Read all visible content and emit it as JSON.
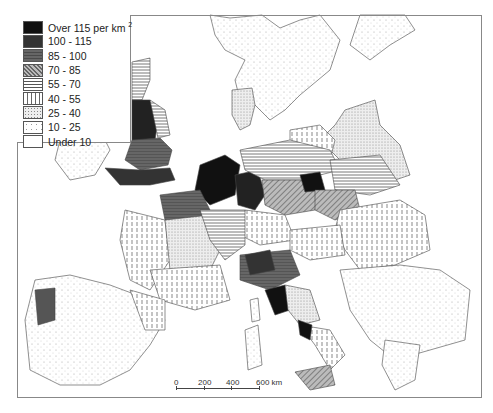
{
  "map": {
    "subject": "Population density, Europe",
    "legend": {
      "items": [
        {
          "label": "Over 115 per km",
          "sup": "2",
          "pattern": "solid-black",
          "fill": "#111111"
        },
        {
          "label": "100 - 115",
          "pattern": "dark-grey",
          "fill": "#3a3a3a"
        },
        {
          "label": "85 - 100",
          "pattern": "mid-dark-grey",
          "fill": "#666666"
        },
        {
          "label": "70 - 85",
          "pattern": "diagonal-hatch",
          "fill": "#9a9a9a"
        },
        {
          "label": "55 - 70",
          "pattern": "horizontal-lines",
          "fill": "#cccccc"
        },
        {
          "label": "40 - 55",
          "pattern": "vertical-dashes",
          "fill": "#e0e0e0"
        },
        {
          "label": "25 - 40",
          "pattern": "dense-dots",
          "fill": "#e8e8e8"
        },
        {
          "label": "10 - 25",
          "pattern": "sparse-dots",
          "fill": "#f4f4f4"
        },
        {
          "label": "Under 10",
          "pattern": "blank",
          "fill": "#ffffff"
        }
      ]
    },
    "scale_bar": {
      "ticks": [
        "0",
        "200",
        "400",
        "600 km"
      ]
    }
  }
}
